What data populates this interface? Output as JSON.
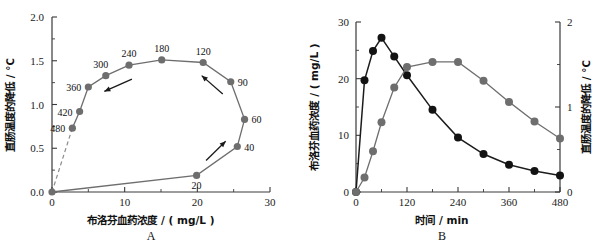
{
  "figure": {
    "panel_a_letter": "A",
    "panel_b_letter": "B"
  },
  "chart_data": [
    {
      "id": "panel-a",
      "type": "scatter",
      "title": "",
      "panel_label": "A",
      "xlabel": "布洛芬血药浓度 / ( mg/L )",
      "ylabel": "直肠温度的降低 / ℃",
      "xlim": [
        0,
        30
      ],
      "ylim": [
        0.0,
        2.0
      ],
      "xticks": [
        0,
        10,
        20,
        30
      ],
      "xticklabels": [
        "0",
        "10",
        "20",
        "30"
      ],
      "xminorticks": [
        5,
        15,
        25
      ],
      "yticks": [
        0.0,
        0.5,
        1.0,
        1.5,
        2.0
      ],
      "yticklabels": [
        "0.0",
        "0.5",
        "1.0",
        "1.5",
        "2.0"
      ],
      "yminorticks": [
        0.25,
        0.75,
        1.25,
        1.75
      ],
      "grid": false,
      "legend": "none",
      "description": "Hysteresis loop of rectal temperature drop versus ibuprofen plasma concentration; points annotated with time in minutes.",
      "points": [
        {
          "label": "",
          "x": 0.0,
          "y": 0.0,
          "label_pos": "none"
        },
        {
          "label": "20",
          "x": 19.9,
          "y": 0.19,
          "label_pos": "below"
        },
        {
          "label": "40",
          "x": 25.5,
          "y": 0.52,
          "label_pos": "right"
        },
        {
          "label": "60",
          "x": 26.5,
          "y": 0.83,
          "label_pos": "right"
        },
        {
          "label": "90",
          "x": 24.6,
          "y": 1.26,
          "label_pos": "right"
        },
        {
          "label": "120",
          "x": 20.8,
          "y": 1.48,
          "label_pos": "above"
        },
        {
          "label": "180",
          "x": 15.1,
          "y": 1.51,
          "label_pos": "above"
        },
        {
          "label": "240",
          "x": 10.6,
          "y": 1.45,
          "label_pos": "above"
        },
        {
          "label": "300",
          "x": 7.4,
          "y": 1.33,
          "label_pos": "above-left"
        },
        {
          "label": "360",
          "x": 5.0,
          "y": 1.2,
          "label_pos": "left"
        },
        {
          "label": "420",
          "x": 3.8,
          "y": 0.92,
          "label_pos": "left"
        },
        {
          "label": "480",
          "x": 2.8,
          "y": 0.73,
          "label_pos": "left"
        }
      ],
      "dashed_segment": {
        "from": [
          0.0,
          0.0
        ],
        "to": [
          2.8,
          0.73
        ]
      },
      "arrows": [
        {
          "name": "ascending-limb-arrow",
          "from": [
            21.2,
            0.36
          ],
          "to": [
            23.9,
            0.58
          ]
        },
        {
          "name": "upper-right-arrow",
          "from": [
            23.5,
            1.12
          ],
          "to": [
            20.6,
            1.33
          ]
        },
        {
          "name": "descending-limb-arrow",
          "from": [
            11.0,
            1.29
          ],
          "to": [
            7.2,
            1.15
          ]
        }
      ]
    },
    {
      "id": "panel-b",
      "type": "line",
      "title": "",
      "panel_label": "B",
      "xlabel": "时间 / min",
      "ylabel": "布洛芬血药浓度 / ( mg/L )",
      "y2label": "直肠温度的降低 / ℃",
      "xlim": [
        0,
        480
      ],
      "ylim": [
        0,
        30
      ],
      "y2lim": [
        0,
        2
      ],
      "xticks": [
        0,
        120,
        240,
        360,
        480
      ],
      "xticklabels": [
        "0",
        "120",
        "240",
        "360",
        "480"
      ],
      "xminorticks": [
        60,
        180,
        300,
        420
      ],
      "yticks": [
        0,
        10,
        20,
        30
      ],
      "yticklabels": [
        "0",
        "10",
        "20",
        "30"
      ],
      "yminorticks": [
        5,
        15,
        25
      ],
      "y2ticks": [
        0,
        1,
        2
      ],
      "y2ticklabels": [
        "0",
        "1",
        "2"
      ],
      "y2minorticks": [
        0.5,
        1.5
      ],
      "grid": false,
      "legend": "none",
      "x": [
        0,
        20,
        40,
        60,
        90,
        120,
        180,
        240,
        300,
        360,
        420,
        480
      ],
      "series": [
        {
          "name": "布洛芬血药浓度",
          "axis": "left",
          "color": "#131313",
          "units": "mg/L",
          "values": [
            0.0,
            19.7,
            24.9,
            27.2,
            23.9,
            20.6,
            14.5,
            9.6,
            6.7,
            4.8,
            3.7,
            2.9
          ]
        },
        {
          "name": "直肠温度的降低",
          "axis": "right",
          "color": "#6e6e6e",
          "units": "℃",
          "values": [
            0.0,
            0.17,
            0.48,
            0.82,
            1.23,
            1.47,
            1.53,
            1.53,
            1.31,
            1.06,
            0.83,
            0.63
          ]
        }
      ]
    }
  ]
}
